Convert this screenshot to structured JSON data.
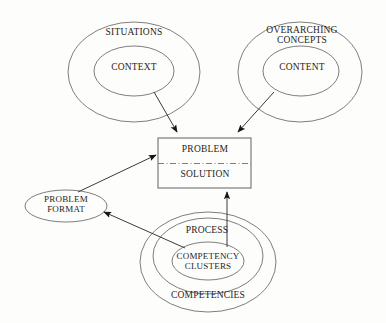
{
  "diagram": {
    "background_color": "#fdfdfc",
    "stroke_color": "#6f6f6f",
    "text_color": "#1d1d1d",
    "nodes": {
      "situations": {
        "label": "SITUATIONS",
        "shape": "ellipse"
      },
      "context": {
        "label": "CONTEXT",
        "shape": "ellipse"
      },
      "overarching_concepts": {
        "label": "OVERARCHING\nCONCEPTS",
        "shape": "ellipse"
      },
      "content": {
        "label": "CONTENT",
        "shape": "ellipse"
      },
      "problem": {
        "label": "PROBLEM",
        "shape": "rectangle-top-half"
      },
      "solution": {
        "label": "SOLUTION",
        "shape": "rectangle-bottom-half"
      },
      "problem_format": {
        "label": "PROBLEM\nFORMAT",
        "shape": "ellipse"
      },
      "process": {
        "label": "PROCESS",
        "shape": "ellipse"
      },
      "competency_clusters": {
        "label": "COMPETENCY\nCLUSTERS",
        "shape": "ellipse"
      },
      "competencies": {
        "label": "COMPETENCIES",
        "shape": "ellipse"
      }
    },
    "edges": [
      {
        "from": "context",
        "to": "problem",
        "style": "arrow"
      },
      {
        "from": "content",
        "to": "problem",
        "style": "arrow"
      },
      {
        "from": "problem_format",
        "to": "problem",
        "style": "arrow"
      },
      {
        "from": "competency_clusters",
        "to": "solution",
        "style": "arrow"
      },
      {
        "from": "competency_clusters",
        "to": "problem_format",
        "style": "arrow"
      }
    ],
    "divider": {
      "between": [
        "problem",
        "solution"
      ],
      "style": "dash-dot"
    }
  }
}
